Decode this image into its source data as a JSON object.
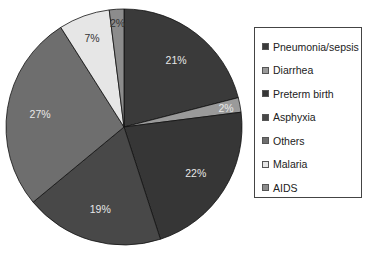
{
  "chart_data": {
    "type": "pie",
    "title": "",
    "categories": [
      "Pneumonia/sepsis",
      "Diarrhea",
      "Preterm birth",
      "Asphyxia",
      "Others",
      "Malaria",
      "AIDS"
    ],
    "values": [
      21,
      2,
      22,
      19,
      27,
      7,
      2
    ],
    "labels": [
      "21%",
      "2%",
      "22%",
      "19%",
      "27%",
      "7%",
      "2%"
    ],
    "colors": [
      "#3a3a3a",
      "#9a9a9a",
      "#363636",
      "#484848",
      "#6e6e6e",
      "#e6e6e6",
      "#8c8c8c"
    ],
    "label_dark": [
      false,
      false,
      false,
      false,
      false,
      true,
      true
    ],
    "start_angle_deg": 0,
    "direction": "clockwise",
    "legend_position": "right"
  },
  "legend": {
    "items": [
      {
        "label": "Pneumonia/sepsis",
        "color": "#3a3a3a"
      },
      {
        "label": "Diarrhea",
        "color": "#9a9a9a"
      },
      {
        "label": "Preterm birth",
        "color": "#363636"
      },
      {
        "label": "Asphyxia",
        "color": "#484848"
      },
      {
        "label": "Others",
        "color": "#6e6e6e"
      },
      {
        "label": "Malaria",
        "color": "#e6e6e6"
      },
      {
        "label": "AIDS",
        "color": "#8c8c8c"
      }
    ]
  }
}
